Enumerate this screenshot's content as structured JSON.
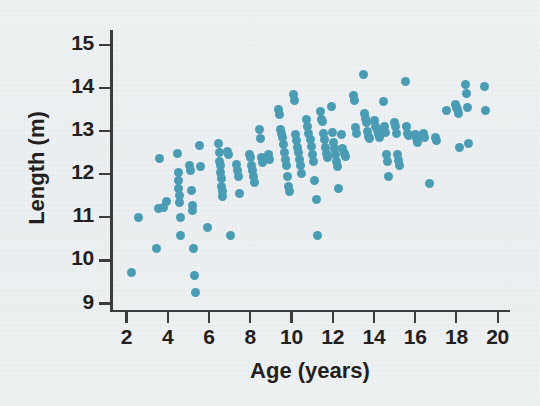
{
  "figure": {
    "background_color": "#eef1f3",
    "point_color": "#4a9cb5",
    "axis_color": "#3c3c3c",
    "text_color": "#231f20"
  },
  "chart_data": {
    "type": "scatter",
    "title": "",
    "xlabel": "Age (years)",
    "ylabel": "Length (m)",
    "xlim": [
      1.2,
      20.6
    ],
    "ylim": [
      8.85,
      15.35
    ],
    "xticks": [
      2,
      4,
      6,
      8,
      10,
      12,
      14,
      16,
      18,
      20
    ],
    "yticks": [
      9,
      10,
      11,
      12,
      13,
      14,
      15
    ],
    "xtick_labels": [
      "2",
      "4",
      "6",
      "8",
      "10",
      "12",
      "14",
      "16",
      "18",
      "20"
    ],
    "ytick_labels": [
      "9",
      "10",
      "11",
      "12",
      "13",
      "14",
      "15"
    ],
    "grid": false,
    "legend": null,
    "marker": "circle",
    "marker_size": 9,
    "n_points": 160,
    "points": [
      [
        2.25,
        9.72
      ],
      [
        2.6,
        11.0
      ],
      [
        3.45,
        10.28
      ],
      [
        3.55,
        11.2
      ],
      [
        3.62,
        12.37
      ],
      [
        3.8,
        11.22
      ],
      [
        3.95,
        11.38
      ],
      [
        4.45,
        12.48
      ],
      [
        4.5,
        12.05
      ],
      [
        4.5,
        11.85
      ],
      [
        4.52,
        11.68
      ],
      [
        4.55,
        11.5
      ],
      [
        4.58,
        11.35
      ],
      [
        4.6,
        11.0
      ],
      [
        4.6,
        10.57
      ],
      [
        5.05,
        12.2
      ],
      [
        5.1,
        12.1
      ],
      [
        5.15,
        11.62
      ],
      [
        5.2,
        11.28
      ],
      [
        5.22,
        11.15
      ],
      [
        5.25,
        10.28
      ],
      [
        5.3,
        9.65
      ],
      [
        5.35,
        9.25
      ],
      [
        5.55,
        12.67
      ],
      [
        5.6,
        12.18
      ],
      [
        5.95,
        10.77
      ],
      [
        6.45,
        12.72
      ],
      [
        6.5,
        12.5
      ],
      [
        6.52,
        12.3
      ],
      [
        6.55,
        12.2
      ],
      [
        6.58,
        12.05
      ],
      [
        6.6,
        11.9
      ],
      [
        6.62,
        11.72
      ],
      [
        6.65,
        11.6
      ],
      [
        6.68,
        11.48
      ],
      [
        6.9,
        12.52
      ],
      [
        6.95,
        12.45
      ],
      [
        7.05,
        10.57
      ],
      [
        7.35,
        12.22
      ],
      [
        7.4,
        12.1
      ],
      [
        7.45,
        11.95
      ],
      [
        7.5,
        11.55
      ],
      [
        7.95,
        12.45
      ],
      [
        8.0,
        12.4
      ],
      [
        8.05,
        12.2
      ],
      [
        8.1,
        12.08
      ],
      [
        8.15,
        11.95
      ],
      [
        8.2,
        11.82
      ],
      [
        8.45,
        13.03
      ],
      [
        8.5,
        12.82
      ],
      [
        8.55,
        12.4
      ],
      [
        8.6,
        12.28
      ],
      [
        8.9,
        12.45
      ],
      [
        8.95,
        12.35
      ],
      [
        9.35,
        13.5
      ],
      [
        9.4,
        13.38
      ],
      [
        9.45,
        13.05
      ],
      [
        9.5,
        12.95
      ],
      [
        9.55,
        12.85
      ],
      [
        9.6,
        12.7
      ],
      [
        9.65,
        12.5
      ],
      [
        9.7,
        12.35
      ],
      [
        9.75,
        12.2
      ],
      [
        9.8,
        11.95
      ],
      [
        9.85,
        11.72
      ],
      [
        9.9,
        11.6
      ],
      [
        10.1,
        13.85
      ],
      [
        10.15,
        13.72
      ],
      [
        10.2,
        12.92
      ],
      [
        10.25,
        12.78
      ],
      [
        10.3,
        12.62
      ],
      [
        10.35,
        12.5
      ],
      [
        10.4,
        12.35
      ],
      [
        10.45,
        12.2
      ],
      [
        10.5,
        12.02
      ],
      [
        10.75,
        13.28
      ],
      [
        10.8,
        13.1
      ],
      [
        10.85,
        12.95
      ],
      [
        10.9,
        12.8
      ],
      [
        10.95,
        12.65
      ],
      [
        11.0,
        12.45
      ],
      [
        11.05,
        12.3
      ],
      [
        11.1,
        11.85
      ],
      [
        11.2,
        11.42
      ],
      [
        11.25,
        10.57
      ],
      [
        11.4,
        13.45
      ],
      [
        11.45,
        13.28
      ],
      [
        11.5,
        13.22
      ],
      [
        11.55,
        12.95
      ],
      [
        11.6,
        12.8
      ],
      [
        11.65,
        12.62
      ],
      [
        11.7,
        12.48
      ],
      [
        11.75,
        12.38
      ],
      [
        11.95,
        13.58
      ],
      [
        12.0,
        12.98
      ],
      [
        12.05,
        12.75
      ],
      [
        12.1,
        12.6
      ],
      [
        12.15,
        12.45
      ],
      [
        12.2,
        12.3
      ],
      [
        12.25,
        12.18
      ],
      [
        12.3,
        11.68
      ],
      [
        12.45,
        12.92
      ],
      [
        12.5,
        12.6
      ],
      [
        12.55,
        12.48
      ],
      [
        12.6,
        12.42
      ],
      [
        13.0,
        13.82
      ],
      [
        13.05,
        13.72
      ],
      [
        13.1,
        13.08
      ],
      [
        13.15,
        12.95
      ],
      [
        13.5,
        14.32
      ],
      [
        13.55,
        13.42
      ],
      [
        13.6,
        13.3
      ],
      [
        13.65,
        13.2
      ],
      [
        13.7,
        13.0
      ],
      [
        13.75,
        12.88
      ],
      [
        13.8,
        12.82
      ],
      [
        14.05,
        13.25
      ],
      [
        14.1,
        13.1
      ],
      [
        14.15,
        13.02
      ],
      [
        14.2,
        12.92
      ],
      [
        14.25,
        12.85
      ],
      [
        14.45,
        13.68
      ],
      [
        14.5,
        13.1
      ],
      [
        14.55,
        12.98
      ],
      [
        14.6,
        12.45
      ],
      [
        14.65,
        12.3
      ],
      [
        14.7,
        11.95
      ],
      [
        15.0,
        13.2
      ],
      [
        15.05,
        13.1
      ],
      [
        15.1,
        12.95
      ],
      [
        15.15,
        12.45
      ],
      [
        15.2,
        12.32
      ],
      [
        15.25,
        12.2
      ],
      [
        15.55,
        14.15
      ],
      [
        15.6,
        13.12
      ],
      [
        15.65,
        12.95
      ],
      [
        15.7,
        12.9
      ],
      [
        16.0,
        12.92
      ],
      [
        16.05,
        12.82
      ],
      [
        16.1,
        12.75
      ],
      [
        16.4,
        12.95
      ],
      [
        16.45,
        12.85
      ],
      [
        16.7,
        11.78
      ],
      [
        17.0,
        12.85
      ],
      [
        17.05,
        12.78
      ],
      [
        17.5,
        13.48
      ],
      [
        17.95,
        13.62
      ],
      [
        18.0,
        13.55
      ],
      [
        18.05,
        13.5
      ],
      [
        18.1,
        13.42
      ],
      [
        18.15,
        12.62
      ],
      [
        18.45,
        14.08
      ],
      [
        18.5,
        13.88
      ],
      [
        18.55,
        13.55
      ],
      [
        18.6,
        12.72
      ],
      [
        19.35,
        14.05
      ],
      [
        19.4,
        13.48
      ]
    ]
  },
  "axes": {
    "x_title": "Age (years)",
    "y_title": "Length (m)"
  }
}
